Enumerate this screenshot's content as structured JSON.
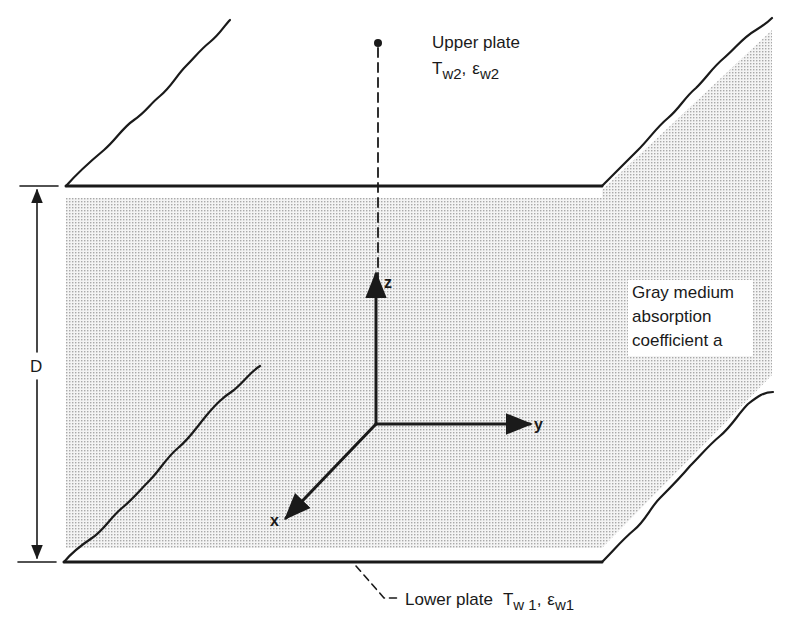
{
  "diagram": {
    "type": "3d-schematic",
    "colors": {
      "ink": "#1a1a1a",
      "medium_shade": "#e4e4e4",
      "background": "#ffffff"
    },
    "upper_plate": {
      "title": "Upper plate",
      "temperature_symbol": "T",
      "temperature_subscript": "w2",
      "separator": ",",
      "emissivity_symbol": "ε",
      "emissivity_subscript": "w2"
    },
    "lower_plate": {
      "title": "Lower plate",
      "temperature_symbol": "T",
      "temperature_subscript": "w 1",
      "separator": ",",
      "emissivity_symbol": "ε",
      "emissivity_subscript": "w1"
    },
    "medium": {
      "line1": "Gray medium",
      "line2": "absorption",
      "line3": "coefficient  a"
    },
    "dimension": {
      "label": "D"
    },
    "axes": {
      "x": "x",
      "y": "y",
      "z": "z"
    }
  }
}
